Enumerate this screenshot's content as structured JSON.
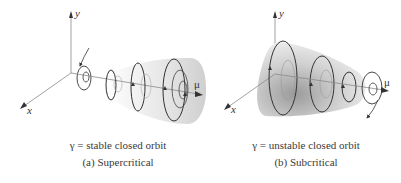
{
  "panels": [
    {
      "id": "a",
      "axis_labels": {
        "y": "y",
        "x": "x",
        "mu": "μ"
      },
      "orbit_caption": "γ = stable closed orbit",
      "title": "(a)  Supercritical"
    },
    {
      "id": "b",
      "axis_labels": {
        "y": "y",
        "x": "x",
        "mu": "μ"
      },
      "orbit_caption": "γ = unstable closed orbit",
      "title": "(b)  Subcritical"
    }
  ],
  "colors": {
    "line": "#333333",
    "surface_light": "#f2f2f2",
    "surface_dark": "#c8c8c8",
    "axis": "#8a8a8a"
  }
}
